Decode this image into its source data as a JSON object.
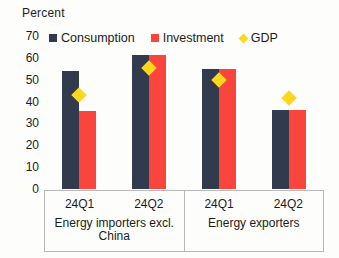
{
  "chart": {
    "axis_title": "Percent",
    "y_ticks": [
      "70",
      "60",
      "50",
      "40",
      "30",
      "20",
      "10",
      "0"
    ],
    "legend": [
      {
        "label": "Consumption",
        "color": "#323a4e",
        "marker": "square",
        "icon": "square-swatch-icon"
      },
      {
        "label": "Investment",
        "color": "#f9453b",
        "marker": "square",
        "icon": "square-swatch-icon"
      },
      {
        "label": "GDP",
        "color": "#ffd61e",
        "marker": "diamond",
        "icon": "diamond-swatch-icon"
      }
    ],
    "groups": [
      {
        "name": "Energy importers excl. China",
        "clusters": [
          {
            "label": "24Q1",
            "consumption": 54,
            "investment": 35.5,
            "gdp": 43
          },
          {
            "label": "24Q2",
            "consumption": 61.5,
            "investment": 61.5,
            "gdp": 55.5
          }
        ]
      },
      {
        "name": "Energy exporters",
        "clusters": [
          {
            "label": "24Q1",
            "consumption": 55,
            "investment": 55,
            "gdp": 50
          },
          {
            "label": "24Q2",
            "consumption": 36,
            "investment": 36,
            "gdp": 41.5
          }
        ]
      }
    ]
  },
  "chart_data": {
    "type": "bar",
    "title": "",
    "subtitle": "",
    "xlabel": "",
    "ylabel": "Percent",
    "ylim": [
      0,
      70
    ],
    "ytick_step": 10,
    "grid": false,
    "legend_position": "top",
    "categories": [
      "24Q1",
      "24Q2",
      "24Q1",
      "24Q2"
    ],
    "group_labels": [
      "Energy importers excl. China",
      "Energy exporters"
    ],
    "group_spans": [
      2,
      2
    ],
    "series": [
      {
        "name": "Consumption",
        "type": "bar",
        "color": "#323a4e",
        "values": [
          54,
          61.5,
          55,
          36
        ]
      },
      {
        "name": "Investment",
        "type": "bar",
        "color": "#f9453b",
        "values": [
          35.5,
          61.5,
          55,
          36
        ]
      },
      {
        "name": "GDP",
        "type": "marker",
        "marker": "diamond",
        "color": "#ffd61e",
        "values": [
          43,
          55.5,
          50,
          41.5
        ]
      }
    ],
    "annotations": []
  }
}
